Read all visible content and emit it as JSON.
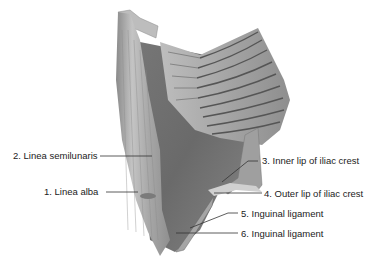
{
  "figure": {
    "labels": [
      {
        "id": "label-1",
        "text": "1. Linea alba"
      },
      {
        "id": "label-2",
        "text": "2. Linea semilunaris"
      },
      {
        "id": "label-3",
        "text": "3. Inner lip of iliac crest"
      },
      {
        "id": "label-4",
        "text": "4. Outer lip of iliac crest"
      },
      {
        "id": "label-5",
        "text": "5. Inguinal ligament"
      },
      {
        "id": "label-6",
        "text": "6. Inguinal ligament"
      }
    ]
  },
  "colors": {
    "background": "#ffffff",
    "muscle_dark": "#6e6e6e",
    "muscle_mid": "#9a9a9a",
    "muscle_light": "#c8c8c8",
    "rib_dark": "#555555",
    "leader_line": "#333333",
    "label_text": "#222222"
  }
}
